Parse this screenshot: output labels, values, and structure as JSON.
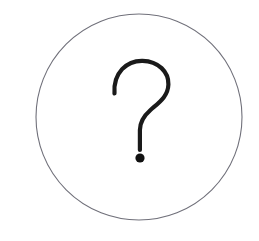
{
  "canvas": {
    "width": 259,
    "height": 241,
    "background_color": "#ffffff"
  },
  "graphic": {
    "name": "question-mark-in-circle",
    "description": "A thin gray circular outline enclosing a hand-drawn style black question mark",
    "alt_text": "?"
  },
  "circle": {
    "center_x": 139,
    "center_y": 117,
    "radius": 103,
    "stroke_color": "#70707a",
    "stroke_width": 1.1,
    "fill": "none"
  },
  "question_mark": {
    "glyph": "?",
    "stroke_color": "#1a1a1a",
    "stroke_width": 4.2,
    "hook_path": "M 114.5 93.5 C 113.0 72.5 127.0 60.5 142.5 60.8 C 158.5 61.2 168.8 72.0 168.4 84.5 C 168.0 96.5 159.0 102.5 150.5 110.0 C 143.0 116.6 139.9 122.0 139.9 130.0 L 139.9 150.0",
    "dot": {
      "center_x": 140,
      "center_y": 158,
      "radius": 4.6,
      "fill_color": "#111111"
    }
  }
}
